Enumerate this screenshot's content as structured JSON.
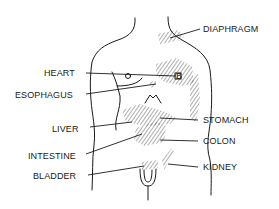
{
  "figure": {
    "labels_left": [
      {
        "id": "heart",
        "text": "HEART"
      },
      {
        "id": "esophagus",
        "text": "ESOPHAGUS"
      },
      {
        "id": "liver",
        "text": "LIVER"
      },
      {
        "id": "intestine",
        "text": "INTESTINE"
      },
      {
        "id": "bladder",
        "text": "BLADDER"
      }
    ],
    "labels_right": [
      {
        "id": "diaphragm",
        "text": "DIAPHRAGM"
      },
      {
        "id": "stomach",
        "text": "STOMACH"
      },
      {
        "id": "colon",
        "text": "COLON"
      },
      {
        "id": "kidney",
        "text": "KIDNEY"
      }
    ],
    "marker_heart": "o",
    "marker_stomach": "B",
    "colors": {
      "ink": "#1a1a1a",
      "background": "#ffffff"
    }
  }
}
